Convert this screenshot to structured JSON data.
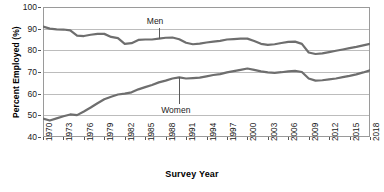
{
  "chart_data": {
    "type": "line",
    "title": "",
    "xlabel": "Survey Year",
    "ylabel": "Percent Employed (%)",
    "xlim": [
      1970,
      2018
    ],
    "ylim": [
      40,
      100
    ],
    "yticks": [
      40,
      50,
      60,
      70,
      80,
      90,
      100
    ],
    "xticks": [
      1970,
      1973,
      1976,
      1979,
      1982,
      1985,
      1988,
      1991,
      1994,
      1997,
      2000,
      2003,
      2006,
      2009,
      2012,
      2015,
      2018
    ],
    "grid": "horizontal",
    "legend": "inline-annotations",
    "line_color": "#6e6e6e",
    "grid_color": "#bcbcbc",
    "x": [
      1970,
      1971,
      1972,
      1973,
      1974,
      1975,
      1976,
      1977,
      1978,
      1979,
      1980,
      1981,
      1982,
      1983,
      1984,
      1985,
      1986,
      1987,
      1988,
      1989,
      1990,
      1991,
      1992,
      1993,
      1994,
      1995,
      1996,
      1997,
      1998,
      1999,
      2000,
      2001,
      2002,
      2003,
      2004,
      2005,
      2006,
      2007,
      2008,
      2009,
      2010,
      2011,
      2012,
      2013,
      2014,
      2015,
      2016,
      2017,
      2018
    ],
    "series": [
      {
        "name": "Men",
        "values": [
          91.0,
          90.0,
          89.7,
          89.6,
          89.2,
          86.8,
          86.6,
          87.2,
          87.6,
          87.6,
          86.2,
          85.6,
          83.0,
          83.3,
          84.8,
          85.0,
          85.0,
          85.4,
          85.8,
          85.9,
          85.1,
          83.5,
          82.8,
          83.1,
          83.6,
          84.0,
          84.4,
          85.0,
          85.2,
          85.4,
          85.4,
          84.3,
          83.0,
          82.5,
          82.8,
          83.4,
          83.9,
          84.0,
          83.0,
          79.0,
          78.3,
          78.6,
          79.2,
          79.8,
          80.4,
          81.0,
          81.6,
          82.3,
          83.0
        ]
      },
      {
        "name": "Women",
        "values": [
          48.5,
          47.6,
          48.6,
          49.6,
          50.4,
          50.1,
          51.8,
          53.6,
          55.6,
          57.4,
          58.6,
          59.6,
          60.0,
          60.6,
          62.0,
          63.0,
          64.0,
          65.2,
          66.0,
          67.0,
          67.5,
          67.0,
          67.2,
          67.4,
          68.0,
          68.6,
          69.0,
          69.8,
          70.4,
          71.0,
          71.6,
          71.0,
          70.3,
          69.8,
          69.6,
          69.9,
          70.3,
          70.5,
          70.0,
          67.0,
          66.0,
          66.2,
          66.6,
          67.0,
          67.6,
          68.2,
          68.9,
          69.8,
          70.8
        ]
      }
    ],
    "annotations": [
      {
        "text": "Men",
        "target_series": "Men"
      },
      {
        "text": "Women",
        "target_series": "Women"
      }
    ]
  },
  "source_note": ""
}
